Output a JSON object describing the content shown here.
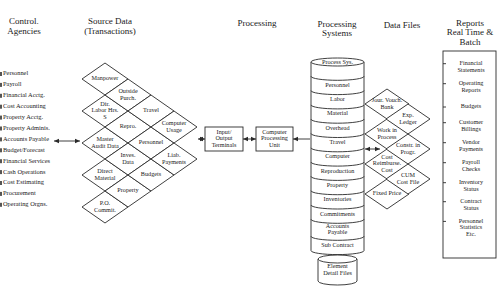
{
  "headers": {
    "control_agencies": [
      "Control.",
      "Agencies"
    ],
    "source_data": [
      "Source Data",
      "(Transactions)"
    ],
    "processing": "Processing",
    "processing_systems": [
      "Processing",
      "Systems"
    ],
    "data_files": "Data Files",
    "reports": [
      "Reports",
      "Real Time &",
      "Batch"
    ]
  },
  "control_agencies": [
    "Personnel",
    "Payroll",
    "Financial Acctg.",
    "Cost Accounting",
    "Property Acctg.",
    "Property Adminis.",
    "Accounts Payable",
    "Budget/Forecast",
    "Financial Services",
    "Cash Operations",
    "Cost Estimating",
    "Procurement",
    "Operating Orgns."
  ],
  "source_data": {
    "col1": [
      [
        "Manpower"
      ],
      [
        "Dir.",
        "Labor Hrs.",
        "S"
      ],
      [
        "Master",
        "Audit Data"
      ],
      [
        "Direct",
        "Material"
      ],
      [
        "P.O.",
        "Commit."
      ]
    ],
    "col2": [
      [
        "Outside",
        "Purch."
      ],
      [
        "Repro."
      ],
      [
        "Inves.",
        "Data"
      ],
      [
        "Property"
      ]
    ],
    "col3": [
      [
        "Travel"
      ],
      [
        "Personnel"
      ],
      [
        "Budgets"
      ]
    ],
    "col4": [
      [
        "Computer",
        "Usage"
      ],
      [
        "Liab.",
        "Payments"
      ]
    ]
  },
  "processing": {
    "io_terminals": [
      "Input/",
      "Output",
      "Terminals"
    ],
    "cpu": [
      "Computer",
      "Processing",
      "Unit"
    ]
  },
  "processing_systems": [
    [
      "Process Sys."
    ],
    [
      "Personnel"
    ],
    [
      "Labor"
    ],
    [
      "Material"
    ],
    [
      "Overhead"
    ],
    [
      "Travel"
    ],
    [
      "Computer"
    ],
    [
      "Reproduction"
    ],
    [
      "Property"
    ],
    [
      "Inventories"
    ],
    [
      "Commitments"
    ],
    [
      "Accounts",
      "Payable"
    ],
    [
      "Sub Contract"
    ]
  ],
  "element_detail_files": [
    "Element",
    "Detail Files"
  ],
  "data_files": {
    "left": [
      [
        "Jour. Vouch.",
        "Bank"
      ],
      [
        "Work in",
        "Process"
      ],
      [
        "Cost",
        "Reimburse.",
        "Cost"
      ],
      [
        "Fixed Price"
      ]
    ],
    "right": [
      [
        "Exp.",
        "Ledger"
      ],
      [
        "Constr. in",
        "Progr."
      ],
      [
        "CUM",
        "Cost File"
      ]
    ]
  },
  "reports": [
    [
      "Financial",
      "Statements"
    ],
    [
      "Operating",
      "Reports"
    ],
    [
      "Budgets"
    ],
    [
      "Customer",
      "Billings"
    ],
    [
      "Vendor",
      "Payments"
    ],
    [
      "Payroll",
      "Checks"
    ],
    [
      "Inventory",
      "Status"
    ],
    [
      "Contract",
      "Status"
    ],
    [
      "Personnel",
      "Statistics",
      "Etc."
    ]
  ]
}
